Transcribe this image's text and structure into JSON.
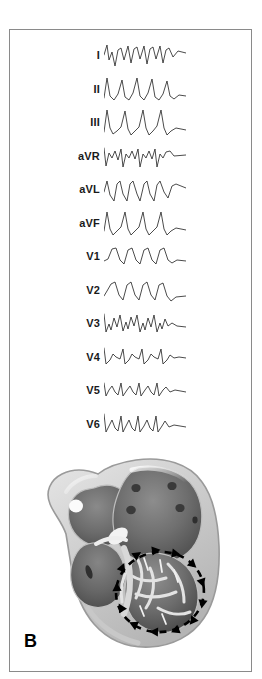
{
  "figure": {
    "panel_label": "B",
    "border_color": "#8a8a8a",
    "background_color": "#ffffff"
  },
  "ecg": {
    "trace_color": "#2b2b2b",
    "label_color": "#1a1a1a",
    "leads": [
      {
        "label": "I",
        "morphology": "negative-deflection-wide-qrs",
        "path": "M0,17 L3,7 L5,22 L8,14 L11,28 L14,12 L17,10 L20,22 L24,8 L27,25 L30,11 L33,9 L36,21 L40,8 L43,26 L46,11 L49,9 L52,21 L56,8 L59,25 L62,12 L65,10 L69,19 L74,13 L82,15"
      },
      {
        "label": "II",
        "morphology": "tall-positive-r-wave",
        "path": "M0,26 L3,6 L6,24 L10,28 L14,22 L18,8 L21,25 L25,28 L29,21 L33,6 L36,24 L40,28 L44,21 L48,7 L51,25 L55,28 L59,22 L63,9 L66,24 L70,27 L75,23 L82,24"
      },
      {
        "label": "III",
        "morphology": "tall-peaked-r-wave",
        "path": "M0,27 L3,5 L6,23 L9,29 L13,26 L17,22 L21,6 L24,24 L27,30 L31,26 L35,22 L39,5 L42,23 L45,30 L49,26 L53,21 L57,5 L60,23 L63,30 L67,26 L72,23 L82,25"
      },
      {
        "label": "aVR",
        "morphology": "notched-negative-complex",
        "path": "M0,9 L2,27 L5,14 L8,19 L11,12 L14,21 L17,10 L19,28 L22,15 L25,19 L28,12 L31,20 L34,10 L36,28 L39,15 L42,19 L45,12 L48,20 L51,10 L53,28 L56,15 L59,19 L62,13 L66,12 L70,17 L82,16"
      },
      {
        "label": "aVL",
        "morphology": "negative-wide-complex",
        "path": "M0,20 L3,9 L6,23 L10,29 L13,12 L16,9 L19,22 L23,29 L26,12 L29,9 L33,22 L36,29 L40,12 L43,9 L46,22 L50,29 L53,13 L56,9 L60,20 L64,26 L68,14 L72,12 L82,16"
      },
      {
        "label": "aVF",
        "morphology": "tall-positive-r-wave",
        "path": "M0,25 L3,6 L6,23 L9,29 L13,25 L17,21 L21,6 L24,23 L27,29 L31,25 L35,21 L39,6 L42,23 L45,29 L49,25 L53,21 L57,6 L60,23 L63,29 L67,25 L72,22 L82,24"
      },
      {
        "label": "V1",
        "morphology": "smooth-rounded-monophasic",
        "path": "M0,22 L4,20 L8,10 L12,9 L16,21 L20,25 L24,11 L28,9 L32,21 L36,25 L40,11 L44,9 L48,21 L52,25 L56,11 L60,9 L64,21 L68,24 L73,21 L82,22"
      },
      {
        "label": "V2",
        "morphology": "smooth-rounded-monophasic",
        "path": "M0,23 L3,18 L7,11 L11,9 L15,22 L19,27 L23,12 L27,9 L31,22 L35,27 L39,12 L43,9 L47,22 L51,27 L55,12 L59,10 L63,23 L67,28 L72,24 L82,23"
      },
      {
        "label": "V3",
        "morphology": "sharp-spiked-rsr",
        "path": "M0,8 L2,26 L5,18 L7,24 L10,12 L13,21 L16,9 L19,25 L22,16 L24,23 L27,11 L30,20 L33,9 L36,26 L39,17 L41,24 L44,12 L47,21 L50,9 L53,26 L56,17 L58,23 L61,13 L64,20 L68,17 L73,20 L82,21"
      },
      {
        "label": "V4",
        "morphology": "sawtooth-rs",
        "path": "M0,8 L2,24 L6,20 L9,14 L12,17 L16,19 L19,9 L21,24 L25,20 L28,14 L31,17 L35,19 L38,9 L40,24 L44,20 L47,14 L50,17 L54,19 L57,9 L59,24 L63,20 L66,15 L70,18 L75,17 L82,18"
      },
      {
        "label": "V5",
        "morphology": "sawtooth-rs",
        "path": "M0,10 L2,23 L5,17 L8,13 L11,19 L14,22 L17,10 L19,23 L23,17 L26,13 L29,19 L32,22 L35,10 L37,23 L41,17 L44,13 L47,19 L50,22 L53,10 L55,23 L59,17 L62,14 L66,19 L71,17 L82,19"
      },
      {
        "label": "V6",
        "morphology": "sawtooth-rs-notched",
        "path": "M0,7 L2,25 L5,19 L8,13 L11,21 L14,24 L17,9 L19,25 L22,19 L25,13 L28,21 L31,24 L34,9 L36,25 L40,19 L43,13 L46,21 L49,24 L52,9 L54,25 L58,19 L61,14 L65,20 L70,18 L82,20"
      }
    ]
  },
  "heart": {
    "description": "cross-section-of-heart-with-ventricular-reentry-circuit",
    "wall_color": "#d5d5d5",
    "chamber_color": "#6f6f6f",
    "outline_color": "#9a9a9a",
    "arrow_color": "#000000",
    "structures": [
      {
        "name": "left-atrium",
        "label": ""
      },
      {
        "name": "right-atrium",
        "label": ""
      },
      {
        "name": "left-ventricle",
        "label": ""
      },
      {
        "name": "right-ventricle",
        "label": ""
      },
      {
        "name": "pulmonary-vein-orifices",
        "label": ""
      },
      {
        "name": "reentry-circuit-loop",
        "label": ""
      }
    ]
  }
}
